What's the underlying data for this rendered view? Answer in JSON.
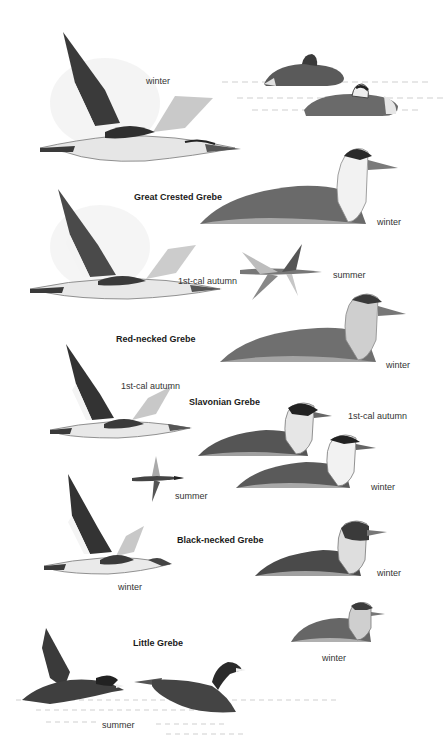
{
  "plate": {
    "species": [
      {
        "name": "Great Crested Grebe",
        "labels": {
          "flight_top": "winter",
          "swim": "winter"
        }
      },
      {
        "name": "Red-necked Grebe",
        "labels": {
          "flight": "1st-cal  autumn",
          "flight_small": "summer",
          "swim": "winter"
        }
      },
      {
        "name": "Slavonian Grebe",
        "labels": {
          "flight": "1st-cal  autumn",
          "swim_upper": "1st-cal  autumn",
          "swim_lower": "winter",
          "flight_small": "summer"
        }
      },
      {
        "name": "Black-necked Grebe",
        "labels": {
          "flight": "winter",
          "swim": "winter"
        }
      },
      {
        "name": "Little Grebe",
        "labels": {
          "swim": "winter",
          "running": "summer"
        }
      }
    ],
    "colors": {
      "ink_dark": "#2b2b2b",
      "ink_mid": "#6e6e6e",
      "ink_light": "#b8b8b8",
      "paper": "#ffffff"
    }
  }
}
